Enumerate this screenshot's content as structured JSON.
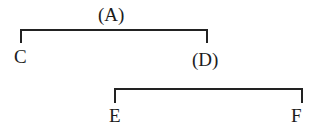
{
  "diagram": {
    "type": "tree",
    "nodes": {
      "root": {
        "id": "A",
        "label": "(A)"
      },
      "left_child": {
        "id": "C",
        "label": "C"
      },
      "right_child": {
        "id": "D",
        "label": "(D)"
      },
      "d_left_child": {
        "id": "E",
        "label": "E"
      },
      "d_right_child": {
        "id": "F",
        "label": "F"
      }
    },
    "edges": [
      {
        "from": "A",
        "to": "C"
      },
      {
        "from": "A",
        "to": "D"
      },
      {
        "from": "D",
        "to": "E"
      },
      {
        "from": "D",
        "to": "F"
      }
    ],
    "colors": {
      "line": "#222222",
      "text": "#1c1c1c",
      "background": "#ffffff"
    }
  }
}
